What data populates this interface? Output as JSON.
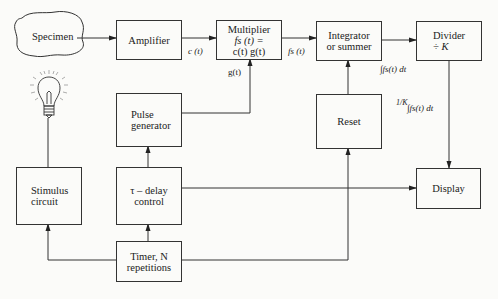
{
  "diagram": {
    "type": "block-diagram",
    "nodes": {
      "specimen": {
        "label": "Specimen"
      },
      "amplifier": {
        "label": "Amplifier"
      },
      "multiplier": {
        "title": "Multiplier",
        "line1": "fs (t) =",
        "line2": "c(t)   g(t)"
      },
      "integrator": {
        "line1": "Integrator",
        "line2": "or summer"
      },
      "divider": {
        "line1": "Divider",
        "line2": "÷  K"
      },
      "pulse_generator": {
        "line1": "Pulse",
        "line2": "generator"
      },
      "reset": {
        "label": "Reset"
      },
      "stimulus_circuit": {
        "line1": "Stimulus",
        "line2": "circuit"
      },
      "delay_control": {
        "line1": "τ – delay",
        "line2": "control"
      },
      "display": {
        "label": "Display"
      },
      "timer": {
        "line1": "Timer,  N",
        "line2": "repetitions"
      },
      "lamp": {
        "icon": "lightbulb-icon"
      }
    },
    "edge_labels": {
      "c_t": "c (t)",
      "g_t": "g(t)",
      "fs_t": "fs (t)",
      "integral": "∫fs(t)  dt",
      "scaled_integral_frac": "1/K",
      "scaled_integral": "∫fs(t)  dt"
    },
    "edges": [
      [
        "specimen",
        "amplifier"
      ],
      [
        "amplifier",
        "multiplier"
      ],
      [
        "pulse_generator",
        "multiplier"
      ],
      [
        "multiplier",
        "integrator"
      ],
      [
        "integrator",
        "divider"
      ],
      [
        "reset",
        "integrator"
      ],
      [
        "divider",
        "display"
      ],
      [
        "delay_control",
        "pulse_generator"
      ],
      [
        "delay_control",
        "display"
      ],
      [
        "timer",
        "delay_control"
      ],
      [
        "timer",
        "stimulus_circuit"
      ],
      [
        "timer",
        "reset"
      ],
      [
        "stimulus_circuit",
        "lamp"
      ]
    ]
  }
}
